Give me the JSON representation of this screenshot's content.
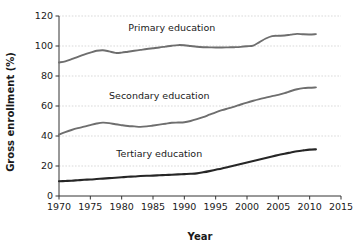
{
  "chart_data": {
    "type": "line",
    "title": "",
    "xlabel": "Year",
    "ylabel": "Gross enrollment (%)",
    "xlim": [
      1970,
      2015
    ],
    "ylim": [
      0,
      120
    ],
    "xticks": [
      1970,
      1975,
      1980,
      1985,
      1990,
      1995,
      2000,
      2005,
      2010,
      2015
    ],
    "yticks": [
      0,
      20,
      40,
      60,
      80,
      100,
      120
    ],
    "grid": true,
    "legend_position": "inline-labels",
    "series": [
      {
        "name": "Primary education",
        "color": "#6e6e6e",
        "label_x": 1988,
        "label_y": 110,
        "x": [
          1970,
          1971,
          1972,
          1973,
          1974,
          1975,
          1976,
          1977,
          1978,
          1979,
          1980,
          1981,
          1982,
          1983,
          1984,
          1985,
          1986,
          1987,
          1988,
          1989,
          1990,
          1991,
          1992,
          1993,
          1994,
          1995,
          1996,
          1997,
          1998,
          1999,
          2000,
          2001,
          2002,
          2003,
          2004,
          2005,
          2006,
          2007,
          2008,
          2009,
          2010,
          2011
        ],
        "values": [
          89.0,
          89.8,
          91.2,
          92.8,
          94.3,
          95.6,
          96.8,
          97.2,
          96.4,
          95.4,
          95.6,
          96.2,
          96.8,
          97.4,
          98.0,
          98.5,
          99.0,
          99.6,
          100.2,
          100.6,
          100.5,
          100.0,
          99.5,
          99.2,
          99.1,
          99.0,
          99.0,
          99.1,
          99.2,
          99.4,
          99.8,
          100.3,
          102.6,
          105.0,
          106.6,
          106.8,
          107.0,
          107.6,
          108.1,
          107.8,
          107.7,
          107.9
        ]
      },
      {
        "name": "Secondary education",
        "color": "#6e6e6e",
        "label_x": 1986,
        "label_y": 65,
        "x": [
          1970,
          1971,
          1972,
          1973,
          1974,
          1975,
          1976,
          1977,
          1978,
          1979,
          1980,
          1981,
          1982,
          1983,
          1984,
          1985,
          1986,
          1987,
          1988,
          1989,
          1990,
          1991,
          1992,
          1993,
          1994,
          1995,
          1996,
          1997,
          1998,
          1999,
          2000,
          2001,
          2002,
          2003,
          2004,
          2005,
          2006,
          2007,
          2008,
          2009,
          2010,
          2011
        ],
        "values": [
          41.0,
          42.6,
          44.0,
          45.2,
          46.2,
          47.3,
          48.3,
          48.9,
          48.6,
          47.8,
          47.2,
          46.7,
          46.4,
          46.1,
          46.4,
          47.0,
          47.6,
          48.2,
          48.8,
          49.0,
          49.2,
          50.0,
          51.2,
          52.6,
          54.2,
          55.8,
          57.2,
          58.4,
          59.6,
          61.0,
          62.3,
          63.5,
          64.6,
          65.6,
          66.6,
          67.4,
          68.6,
          70.0,
          71.2,
          71.9,
          72.2,
          72.4
        ]
      },
      {
        "name": "Tertiary education",
        "color": "#262626",
        "label_x": 1986,
        "label_y": 26,
        "x": [
          1970,
          1971,
          1972,
          1973,
          1974,
          1975,
          1976,
          1977,
          1978,
          1979,
          1980,
          1981,
          1982,
          1983,
          1984,
          1985,
          1986,
          1987,
          1988,
          1989,
          1990,
          1991,
          1992,
          1993,
          1994,
          1995,
          1996,
          1997,
          1998,
          1999,
          2000,
          2001,
          2002,
          2003,
          2004,
          2005,
          2006,
          2007,
          2008,
          2009,
          2010,
          2011
        ],
        "values": [
          9.8,
          10.0,
          10.2,
          10.5,
          10.8,
          11.0,
          11.3,
          11.6,
          11.9,
          12.2,
          12.5,
          12.8,
          13.0,
          13.3,
          13.5,
          13.6,
          13.8,
          14.0,
          14.2,
          14.4,
          14.6,
          14.8,
          15.1,
          15.8,
          16.6,
          17.5,
          18.4,
          19.4,
          20.4,
          21.4,
          22.4,
          23.4,
          24.4,
          25.4,
          26.4,
          27.3,
          28.2,
          29.0,
          29.8,
          30.4,
          30.9,
          31.1
        ]
      }
    ]
  }
}
